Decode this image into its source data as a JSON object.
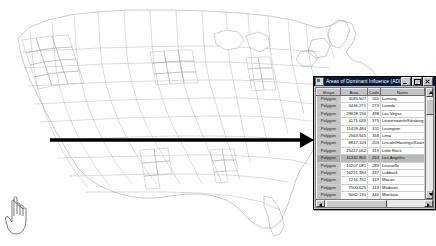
{
  "window": {
    "title": "Areas of Dominant Influence (ADI)",
    "doc_icon": "document-icon",
    "minimize_label": "_",
    "maximize_label": "□",
    "close_label": "×"
  },
  "table": {
    "columns": [
      "Shape",
      "Area",
      "Code",
      "Name"
    ],
    "rows": [
      {
        "shape": "Polygon",
        "area": "3085.507",
        "code": "160",
        "name": "Lansing"
      },
      {
        "shape": "Polygon",
        "area": "4446.271",
        "code": "273",
        "name": "Laredo"
      },
      {
        "shape": "Polygon",
        "area": "29628.156",
        "code": "498",
        "name": "Las Vegas"
      },
      {
        "shape": "Polygon",
        "area": "4171.035",
        "code": "375",
        "name": "Leavenworth/Kittsburg"
      },
      {
        "shape": "Polygon",
        "area": "11429.484",
        "code": "311",
        "name": "Lexington"
      },
      {
        "shape": "Polygon",
        "area": "2563.945",
        "code": "168",
        "name": "Lima"
      },
      {
        "shape": "Polygon",
        "area": "8847.103",
        "code": "203",
        "name": "Lincoln/Hastings/Kearney"
      },
      {
        "shape": "Polygon",
        "area": "25417.062",
        "code": "319",
        "name": "Little Rock"
      },
      {
        "shape": "Polygon",
        "area": "41332.801",
        "code": "253",
        "name": "Los Angeles"
      },
      {
        "shape": "Polygon",
        "area": "10207.081",
        "code": "289",
        "name": "Louisville"
      },
      {
        "shape": "Polygon",
        "area": "16221.384",
        "code": "437",
        "name": "Lubbock"
      },
      {
        "shape": "Polygon",
        "area": "7216.752",
        "code": "319",
        "name": "Macon"
      },
      {
        "shape": "Polygon",
        "area": "7500.625",
        "code": "113",
        "name": "Madison"
      },
      {
        "shape": "Polygon",
        "area": "5062.130",
        "code": "440",
        "name": "Mankato"
      },
      {
        "shape": "Polygon",
        "area": "6346.795",
        "code": "327",
        "name": "Marquette"
      },
      {
        "shape": "Polygon",
        "area": "4321.709",
        "code": "425",
        "name": "McAllen-Brownsville-LRGV"
      },
      {
        "shape": "Polygon",
        "area": "8139.562",
        "code": "238",
        "name": "Medford"
      },
      {
        "shape": "Polygon",
        "area": "17087.410",
        "code": "179",
        "name": "Memphis"
      },
      {
        "shape": "Polygon",
        "area": "5146.336",
        "code": "311",
        "name": "Meridian"
      },
      {
        "shape": "Polygon",
        "area": "4063.672",
        "code": "137",
        "name": "Miami/Ft. Lauderdale"
      }
    ],
    "selected_row_name": "Los Angeles"
  },
  "annotation": {
    "arrow_name": "pointer-arrow",
    "arrow_color": "#000000"
  },
  "map": {
    "name": "united-states-counties-map",
    "outline_color": "#8a8a8a",
    "background": "#ffffff"
  },
  "cursor": {
    "name": "hand-cursor"
  }
}
